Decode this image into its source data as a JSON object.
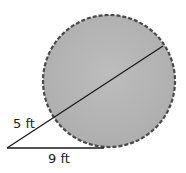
{
  "diagram": {
    "type": "circle-tangent-secant",
    "circle": {
      "cx": 109,
      "cy": 81,
      "r": 66,
      "fill": "#b5b5b5",
      "stroke": "#555555",
      "stroke_style": "dashed"
    },
    "external_point": {
      "x": 7,
      "y": 148
    },
    "tangent_point": {
      "x": 104,
      "y": 148
    },
    "secant_entry": {
      "x": 55,
      "y": 117
    },
    "secant_exit": {
      "x": 163,
      "y": 46
    },
    "labels": {
      "secant_external": "5 ft",
      "tangent": "9 ft"
    }
  }
}
